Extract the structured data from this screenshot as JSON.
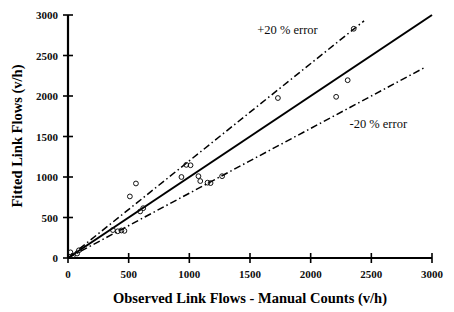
{
  "chart_data": {
    "type": "scatter",
    "title": "",
    "xlabel": "Observed Link Flows - Manual Counts (v/h)",
    "ylabel": "Fitted Link Flows (v/h)",
    "xlim": [
      0,
      3000
    ],
    "ylim": [
      0,
      3000
    ],
    "xticks": [
      0,
      500,
      1000,
      1500,
      2000,
      2500,
      3000
    ],
    "yticks": [
      0,
      500,
      1000,
      1500,
      2000,
      2500,
      3000
    ],
    "xticklabels": [
      "0",
      "500",
      "1000",
      "1500",
      "2000",
      "2500",
      "3000"
    ],
    "yticklabels": [
      "0",
      "500",
      "1000",
      "1500",
      "2000",
      "2500",
      "3000"
    ],
    "grid": false,
    "legend": false,
    "marker": "open-circle",
    "points": [
      {
        "x": 20,
        "y": 70
      },
      {
        "x": 40,
        "y": 30
      },
      {
        "x": 75,
        "y": 55
      },
      {
        "x": 90,
        "y": 95
      },
      {
        "x": 370,
        "y": 345
      },
      {
        "x": 410,
        "y": 330
      },
      {
        "x": 440,
        "y": 340
      },
      {
        "x": 465,
        "y": 335
      },
      {
        "x": 510,
        "y": 760
      },
      {
        "x": 560,
        "y": 920
      },
      {
        "x": 595,
        "y": 575
      },
      {
        "x": 620,
        "y": 615
      },
      {
        "x": 935,
        "y": 1000
      },
      {
        "x": 975,
        "y": 1150
      },
      {
        "x": 1010,
        "y": 1145
      },
      {
        "x": 1075,
        "y": 1010
      },
      {
        "x": 1090,
        "y": 950
      },
      {
        "x": 1150,
        "y": 930
      },
      {
        "x": 1175,
        "y": 925
      },
      {
        "x": 1270,
        "y": 1010
      },
      {
        "x": 1730,
        "y": 1975
      },
      {
        "x": 2210,
        "y": 1990
      },
      {
        "x": 2305,
        "y": 2195
      },
      {
        "x": 2355,
        "y": 2830
      }
    ],
    "lines": [
      {
        "name": "identity-fit-line",
        "style": "solid",
        "slope": 1.0,
        "from_x": 0,
        "to_x": 3000
      },
      {
        "name": "plus-20-error",
        "style": "dash-dot",
        "slope": 1.2,
        "from_x": 0,
        "to_x": 2440
      },
      {
        "name": "minus-20-error",
        "style": "dash-dot",
        "slope": 0.8,
        "from_x": 0,
        "to_x": 2930
      }
    ],
    "annotations": [
      {
        "name": "plus-20-error-label",
        "text": "+20 % error",
        "x": 1560,
        "y": 2760
      },
      {
        "name": "minus-20-error-label",
        "text": "-20 % error",
        "x": 2320,
        "y": 1600
      }
    ]
  },
  "colors": {
    "axis": "#000000",
    "text": "#000000",
    "fit_line": "#000000",
    "error_line": "#000000",
    "marker_stroke": "#111111",
    "background": "#ffffff"
  }
}
